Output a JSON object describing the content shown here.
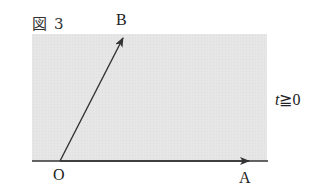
{
  "figure": {
    "label_kanji": "図",
    "label_number": "3"
  },
  "points": {
    "origin": "O",
    "a": "A",
    "b": "B"
  },
  "condition": {
    "variable": "t",
    "relation": "≧",
    "value": "0"
  },
  "colors": {
    "shade": "#e6e6e6",
    "line": "#333333"
  }
}
